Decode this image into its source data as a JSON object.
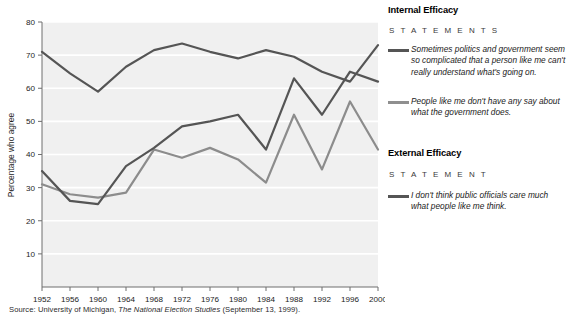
{
  "chart_data": {
    "type": "line",
    "title": "",
    "subtitle": "",
    "xlabel": "",
    "ylabel": "Percentage who agree",
    "xlim": [
      1952,
      2000
    ],
    "ylim": [
      0,
      80
    ],
    "grid": "horizontal-white",
    "legend_position": "right",
    "x": [
      1952,
      1956,
      1960,
      1964,
      1968,
      1972,
      1976,
      1980,
      1984,
      1988,
      1992,
      1996,
      2000
    ],
    "xtick_labels": [
      "1952",
      "1956",
      "1960",
      "1964",
      "1968",
      "1972",
      "1976",
      "1980",
      "1984",
      "1988",
      "1992",
      "1996",
      "2000"
    ],
    "ytick_labels": [
      "10",
      "20",
      "30",
      "40",
      "50",
      "60",
      "70",
      "80"
    ],
    "ytick_values": [
      10,
      20,
      30,
      40,
      50,
      60,
      70,
      80
    ],
    "series": [
      {
        "name": "Sometimes politics and government seem so complicated that a person like me can't really understand what's going on.",
        "group": "Internal Efficacy",
        "color": "#555555",
        "values": [
          71,
          64.5,
          59,
          66.5,
          71.5,
          73.5,
          71,
          69,
          71.5,
          69.5,
          65,
          62,
          73
        ]
      },
      {
        "name": "I don't think public officials care much what people like me think.",
        "group": "External Efficacy",
        "color": "#555555",
        "values": [
          35,
          26,
          25,
          36.5,
          42,
          48.5,
          50,
          52,
          41.5,
          63,
          52,
          65,
          62
        ]
      },
      {
        "name": "People like me don't have any say about what the government does.",
        "group": "Internal Efficacy",
        "color": "#8c8c8c",
        "values": [
          31,
          28,
          27,
          28.5,
          41.5,
          39,
          42,
          38.5,
          31.5,
          52,
          35.5,
          56,
          41.5
        ]
      }
    ]
  },
  "axis": {
    "ylabel": "Percentage who agree"
  },
  "legend": {
    "internal": {
      "heading": "Internal Efficacy",
      "subheading": "S T A T E M E N T S",
      "entries": [
        {
          "text": "Sometimes politics and government seem so complicated that a person like me can't really understand what's going on.",
          "color": "#555555"
        },
        {
          "text": "People like me don't have any say about what the government does.",
          "color": "#8f8f8f"
        }
      ]
    },
    "external": {
      "heading": "External Efficacy",
      "subheading": "S T A T E M E N T",
      "entries": [
        {
          "text": "I don't think public officials care much what people like me think.",
          "color": "#555555"
        }
      ]
    }
  },
  "source": {
    "prefix": "Source: University of Michigan, ",
    "italic": "The National Election Studies",
    "suffix": " (September 13, 1999)."
  }
}
